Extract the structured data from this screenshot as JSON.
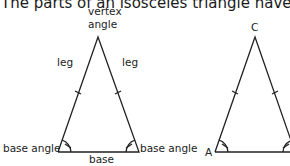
{
  "heading": "The parts of an isosceles triangle have special",
  "figure1": {
    "vertex_label_line1": "vertex",
    "vertex_label_line2": "angle",
    "leg_left": "leg",
    "leg_right": "leg",
    "base_angle_left": "base angle",
    "base_angle_right": "base angle",
    "base": "base"
  },
  "figure2": {
    "vertex_c": "C",
    "vertex_a": "A"
  }
}
